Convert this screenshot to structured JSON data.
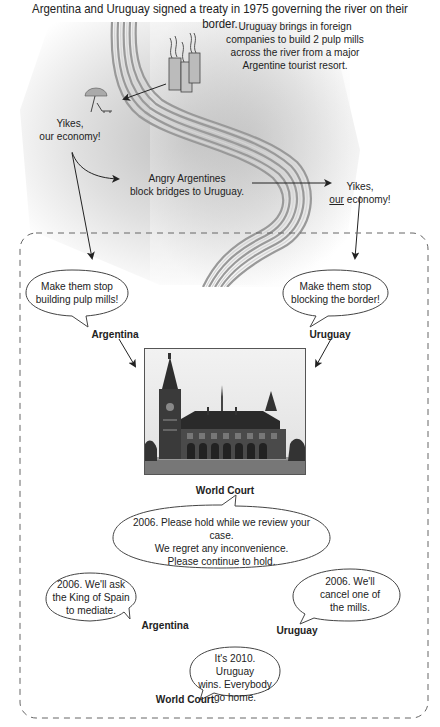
{
  "title": "Argentina and Uruguay signed a treaty in 1975 governing the river on their border.",
  "top_section": {
    "mills_caption": [
      "Uruguay brings in foreign",
      "companies to build 2 pulp mills",
      "across the river from a major",
      "Argentine tourist resort."
    ],
    "argentina_reaction": [
      "Yikes,",
      "our economy!"
    ],
    "blockade_caption": [
      "Angry Argentines",
      "block bridges to Uruguay."
    ],
    "uruguay_reaction": {
      "line1": "Yikes,",
      "underlined": "our",
      "rest": " economy!"
    }
  },
  "icons": {
    "river": "river-icon",
    "factory": "pulp-mill-factory-icon",
    "resort": "beach-umbrella-chair-icon"
  },
  "dispute_box": {
    "argentina_bubble": [
      "Make them stop",
      "building pulp mills!"
    ],
    "argentina_label": "Argentina",
    "uruguay_bubble": [
      "Make them stop",
      "blocking the border!"
    ],
    "uruguay_label": "Uruguay",
    "court_photo": "world-court-building-photo",
    "court_label": "World Court",
    "court_bubble": [
      "2006. Please hold while we review your case.",
      "We regret any inconvenience.",
      "Please continue to hold."
    ],
    "argentina_2006_bubble": [
      "2006. We'll ask",
      "the King of Spain",
      "to mediate."
    ],
    "argentina_2006_label": "Argentina",
    "uruguay_2006_bubble": [
      "2006. We'll",
      "cancel one of",
      "the mills."
    ],
    "uruguay_2006_label": "Uruguay",
    "court_2010_bubble": [
      "It's 2010. Uruguay",
      "wins. Everybody",
      "go home."
    ],
    "court_2010_label": "World Court"
  }
}
